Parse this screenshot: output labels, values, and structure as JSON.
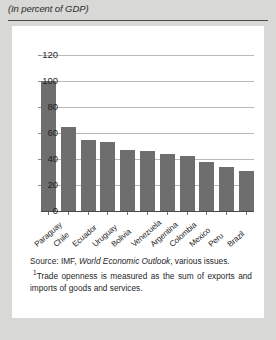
{
  "figure": {
    "subtitle": "(In percent of GDP)",
    "source_prefix": "Source: IMF, ",
    "source_italic": "World Economic Outlook",
    "source_suffix": ", various issues.",
    "footnote_marker": "1",
    "footnote": "Trade openness is measured as the sum of exports and imports of goods and services."
  },
  "chart_data": {
    "type": "bar",
    "title": "",
    "subtitle": "(In percent of GDP)",
    "xlabel": "",
    "ylabel": "",
    "ylim": [
      0,
      120
    ],
    "yticks": [
      120,
      100,
      80,
      60,
      40,
      20,
      0
    ],
    "grid": true,
    "legend": "none",
    "bar_color": "#6e6e6e",
    "categories": [
      "Paraguay",
      "Chile",
      "Ecuador",
      "Uruguay",
      "Bolivia",
      "Venezuela",
      "Argentina",
      "Colombia",
      "Mexico",
      "Peru",
      "Brazil"
    ],
    "values": [
      100,
      65,
      55,
      53,
      47,
      46,
      44,
      42,
      38,
      34,
      31
    ]
  }
}
